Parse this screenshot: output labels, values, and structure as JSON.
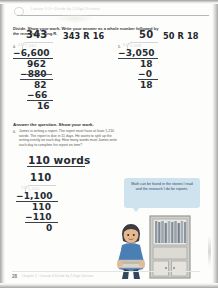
{
  "header": {
    "ghost_text": "Lesson 9.3  •  Divide by 2-Digit Divisors",
    "page_number": "28",
    "footer_note": "Chapter 2 • Lesson 6  Divide by 2-Digit Divisors"
  },
  "instructions": {
    "divide_directions": "Divide. Show your work. Write your answer as a whole number followed by the remainder using R.",
    "answer_directions": "Answer the question. Show your work."
  },
  "problems": [
    {
      "number": "4.",
      "printed_divisor": "22",
      "printed_dividend": "7,562",
      "quotient": "343",
      "steps": [
        {
          "value": "−6,600",
          "struck": false
        },
        {
          "value": "962",
          "struck": false
        },
        {
          "value": "−880",
          "struck": true
        },
        {
          "value": "82",
          "struck": false
        },
        {
          "value": "−66",
          "struck": false
        },
        {
          "value": "16",
          "struck": false
        }
      ],
      "answer": "343 R 16"
    },
    {
      "number": "5.",
      "printed_divisor": "61",
      "printed_dividend": "3,068",
      "quotient": "50",
      "steps": [
        {
          "value": "−3,050",
          "struck": false
        },
        {
          "value": "18",
          "struck": false
        },
        {
          "value": "−0",
          "struck": false
        },
        {
          "value": "18",
          "struck": false
        }
      ],
      "answer": "50 R 18"
    }
  ],
  "word_problem": {
    "number": "6.",
    "text": "James is writing a report. The report must have at least 1,210 words. The report is due in 11 days. He wants to split up the writing evenly on each day. How many words must James write each day to complete his report on time?",
    "answer_value": "110",
    "answer_unit": "words",
    "printed_divisor": "11",
    "printed_dividend": "1,210",
    "quotient": "110",
    "steps": [
      {
        "value": "−1,100"
      },
      {
        "value": "110"
      },
      {
        "value": "−110"
      },
      {
        "value": "0"
      }
    ]
  },
  "illustration": {
    "speech_bubble": "Math can be found in the stories I read and the research I do for reports.",
    "character_name": "boy-character",
    "object_name": "bookshelf"
  },
  "colors": {
    "bubble_fill": "#cfe3ef",
    "bubble_text": "#2e4a5c",
    "handwriting": "#262b33",
    "printed_faint": "#d2d2d2",
    "page_background": "#fdfdfb"
  }
}
